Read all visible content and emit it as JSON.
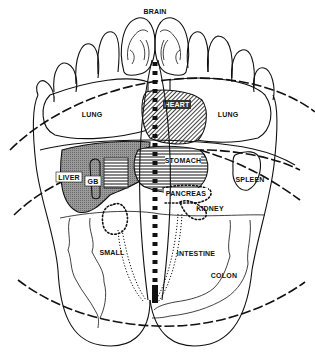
{
  "diagram": {
    "labels": {
      "brain": "BRAIN",
      "lung_left": "LUNG",
      "heart": "HEART",
      "lung_right": "LUNG",
      "stomach": "STOMACH",
      "liver": "LIVER",
      "gb": "GB",
      "spleen": "SPLEEN",
      "pancreas": "PANCREAS",
      "kidney": "KIDNEY",
      "small": "SMALL",
      "intestine": "INTESTINE",
      "colon": "COLON"
    },
    "colors": {
      "ink": "#111111",
      "background": "#ffffff",
      "liver_fill": "#8a8a8a",
      "heart_fill": "#3a3a3a"
    }
  }
}
